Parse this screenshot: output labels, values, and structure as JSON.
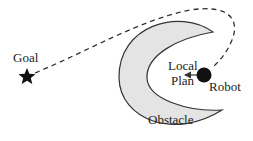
{
  "labels": {
    "goal": "Goal",
    "local_line1": "Local",
    "local_line2": "Plan",
    "robot": "Robot",
    "obstacle": "Obstacle"
  },
  "colors": {
    "obstacle_fill": "#e4e4e4",
    "stroke": "#333333",
    "robot": "#111111",
    "star": "#111111"
  }
}
